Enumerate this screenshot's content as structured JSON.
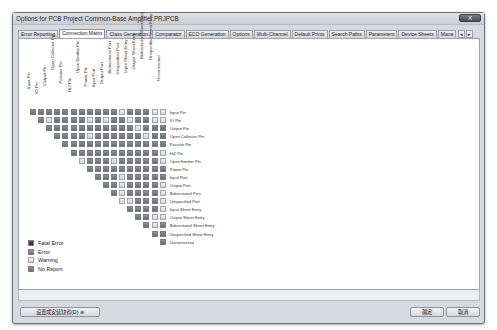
{
  "window": {
    "title": "Options for PCB Project Common-Base Amplifier.PRJPCB",
    "close_label": "X"
  },
  "tabs": [
    {
      "label": "Error Reporting",
      "active": false
    },
    {
      "label": "Connection Matrix",
      "active": true
    },
    {
      "label": "Class Generation",
      "active": false
    },
    {
      "label": "Comparator",
      "active": false
    },
    {
      "label": "ECO Generation",
      "active": false
    },
    {
      "label": "Options",
      "active": false
    },
    {
      "label": "Multi-Channel",
      "active": false
    },
    {
      "label": "Default Prints",
      "active": false
    },
    {
      "label": "Search Paths",
      "active": false
    },
    {
      "label": "Parameters",
      "active": false
    },
    {
      "label": "Device Sheets",
      "active": false
    },
    {
      "label": "Mana",
      "active": false
    }
  ],
  "tab_scroll": {
    "left": "◂",
    "right": "▸"
  },
  "matrix": {
    "items": [
      "Input Pin",
      "IO Pin",
      "Output Pin",
      "Open Collector Pin",
      "Passive Pin",
      "HiZ Pin",
      "Open Emitter Pin",
      "Power Pin",
      "Input Port",
      "Output Port",
      "Bidirectional Port",
      "Unspecified Port",
      "Input Sheet Entry",
      "Output Sheet Entry",
      "Bidirectional Sheet Entry",
      "Unspecified Sheet Entry",
      "Unconnected"
    ],
    "cells": [
      [
        "n",
        "n",
        "n",
        "n",
        "n",
        "n",
        "n",
        "n",
        "n",
        "n",
        "n",
        "w",
        "n",
        "n",
        "n",
        "w",
        "w"
      ],
      [
        "n",
        "w",
        "n",
        "n",
        "n",
        "n",
        "w",
        "n",
        "w",
        "n",
        "n",
        "w",
        "n",
        "n",
        "w",
        "w",
        "n"
      ],
      [
        "n",
        "n",
        "n",
        "n",
        "n",
        "n",
        "n",
        "n",
        "n",
        "n",
        "n",
        "w",
        "n",
        "n",
        "n",
        "w",
        "n"
      ],
      [
        "n",
        "n",
        "n",
        "n",
        "w",
        "n",
        "n",
        "n",
        "n",
        "n",
        "n",
        "w",
        "n",
        "n",
        "n",
        "w",
        "n"
      ],
      [
        "n",
        "n",
        "n",
        "n",
        "n",
        "n",
        "n",
        "n",
        "n",
        "n",
        "n",
        "n",
        "n",
        "n",
        "n",
        "n",
        "n"
      ],
      [
        "n",
        "n",
        "n",
        "n",
        "n",
        "n",
        "n",
        "n",
        "n",
        "n",
        "n",
        "w",
        "n",
        "n",
        "n",
        "w",
        "n"
      ],
      [
        "w",
        "n",
        "n",
        "n",
        "w",
        "n",
        "n",
        "n",
        "n",
        "n",
        "w",
        "n",
        "n",
        "n",
        "n",
        "n",
        "n"
      ],
      [
        "n",
        "n",
        "n",
        "n",
        "n",
        "n",
        "n",
        "n",
        "n",
        "n",
        "n",
        "n",
        "n",
        "n",
        "n",
        "n",
        "n"
      ],
      [
        "n",
        "n",
        "n",
        "w",
        "n",
        "n",
        "n",
        "n",
        "n",
        "w",
        "n",
        "n",
        "n",
        "n",
        "n",
        "n",
        "n"
      ],
      [
        "n",
        "n",
        "w",
        "n",
        "n",
        "n",
        "n",
        "w",
        "n",
        "n",
        "n",
        "n",
        "n",
        "n",
        "n",
        "n",
        "n"
      ],
      [
        "n",
        "w",
        "n",
        "n",
        "n",
        "n",
        "w",
        "n",
        "n",
        "n",
        "n",
        "n",
        "n",
        "n",
        "n",
        "n",
        "n"
      ],
      [
        "w",
        "w",
        "n",
        "n",
        "n",
        "w",
        "w",
        "n",
        "n",
        "n",
        "n",
        "n",
        "n",
        "n",
        "n",
        "n",
        "n"
      ],
      [
        "n",
        "n",
        "n",
        "n",
        "w",
        "n",
        "n",
        "n",
        "n",
        "n",
        "n",
        "n",
        "n",
        "n",
        "n",
        "n",
        "n"
      ],
      [
        "n",
        "n",
        "w",
        "w",
        "n",
        "n",
        "n",
        "n",
        "n",
        "n",
        "n",
        "n",
        "n",
        "n",
        "n",
        "n",
        "n"
      ],
      [
        "n",
        "w",
        "n",
        "n",
        "n",
        "n",
        "n",
        "n",
        "n",
        "n",
        "n",
        "n",
        "n",
        "n",
        "n",
        "n",
        "n"
      ],
      [
        "n",
        "n",
        "n",
        "n",
        "n",
        "n",
        "n",
        "n",
        "n",
        "n",
        "n",
        "n",
        "n",
        "n",
        "n",
        "n",
        "n"
      ],
      [
        "n",
        "n",
        "n",
        "n",
        "n",
        "n",
        "n",
        "n",
        "n",
        "n",
        "n",
        "n",
        "n",
        "n",
        "n",
        "n",
        "n"
      ]
    ]
  },
  "legend": [
    {
      "key": "fatal",
      "label": "Fatal Error"
    },
    {
      "key": "error",
      "label": "Error"
    },
    {
      "key": "warning",
      "label": "Warning"
    },
    {
      "key": "noreport",
      "label": "No Report"
    }
  ],
  "footer": {
    "set_default_label": "设置成安装缺省(D) ⊛",
    "ok_label": "确定",
    "cancel_label": "取消"
  }
}
